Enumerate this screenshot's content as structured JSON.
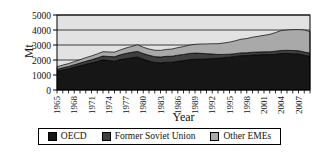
{
  "chart_data": {
    "type": "area",
    "stacked": true,
    "title": "",
    "xlabel": "Year",
    "ylabel": "Mt",
    "unit": "Mt",
    "x_start": 1965,
    "x_end": 2009,
    "ylim": [
      0,
      5000
    ],
    "yticks": [
      0,
      1000,
      2000,
      3000,
      4000,
      5000
    ],
    "xtick_labels": [
      "1965",
      "1968",
      "1971",
      "1974",
      "1977",
      "1980",
      "1983",
      "1986",
      "1989",
      "1992",
      "1995",
      "1998",
      "2001",
      "2004",
      "2007"
    ],
    "legend_position": "bottom",
    "grid": true,
    "plot_bg": "#e2e2e2",
    "gridline_color": "#3c3c3c",
    "axis_color": "#000000",
    "series": [
      {
        "name": "OECD",
        "color": "#161616",
        "values": [
          1250,
          1340,
          1420,
          1520,
          1620,
          1720,
          1800,
          1900,
          2010,
          1960,
          1920,
          2030,
          2090,
          2150,
          2200,
          2050,
          1930,
          1840,
          1810,
          1850,
          1850,
          1920,
          1960,
          2020,
          2050,
          2055,
          2070,
          2100,
          2110,
          2160,
          2190,
          2240,
          2290,
          2300,
          2340,
          2350,
          2360,
          2360,
          2390,
          2430,
          2440,
          2420,
          2400,
          2320,
          2250
        ]
      },
      {
        "name": "Former Soviet Union",
        "color": "#3f3f3f",
        "values": [
          130,
          140,
          150,
          165,
          180,
          195,
          215,
          235,
          255,
          275,
          295,
          315,
          350,
          365,
          375,
          380,
          385,
          385,
          390,
          395,
          400,
          405,
          410,
          415,
          410,
          390,
          350,
          300,
          255,
          215,
          195,
          185,
          185,
          180,
          180,
          180,
          185,
          190,
          200,
          205,
          210,
          215,
          215,
          215,
          210
        ]
      },
      {
        "name": "Other EMEs",
        "color": "#a9a9a9",
        "values": [
          170,
          180,
          190,
          205,
          220,
          240,
          255,
          270,
          290,
          300,
          310,
          325,
          360,
          390,
          440,
          420,
          415,
          425,
          440,
          460,
          480,
          500,
          525,
          555,
          585,
          620,
          650,
          685,
          720,
          760,
          805,
          855,
          910,
          950,
          1000,
          1050,
          1100,
          1160,
          1240,
          1330,
          1350,
          1385,
          1415,
          1465,
          1440
        ]
      }
    ]
  }
}
